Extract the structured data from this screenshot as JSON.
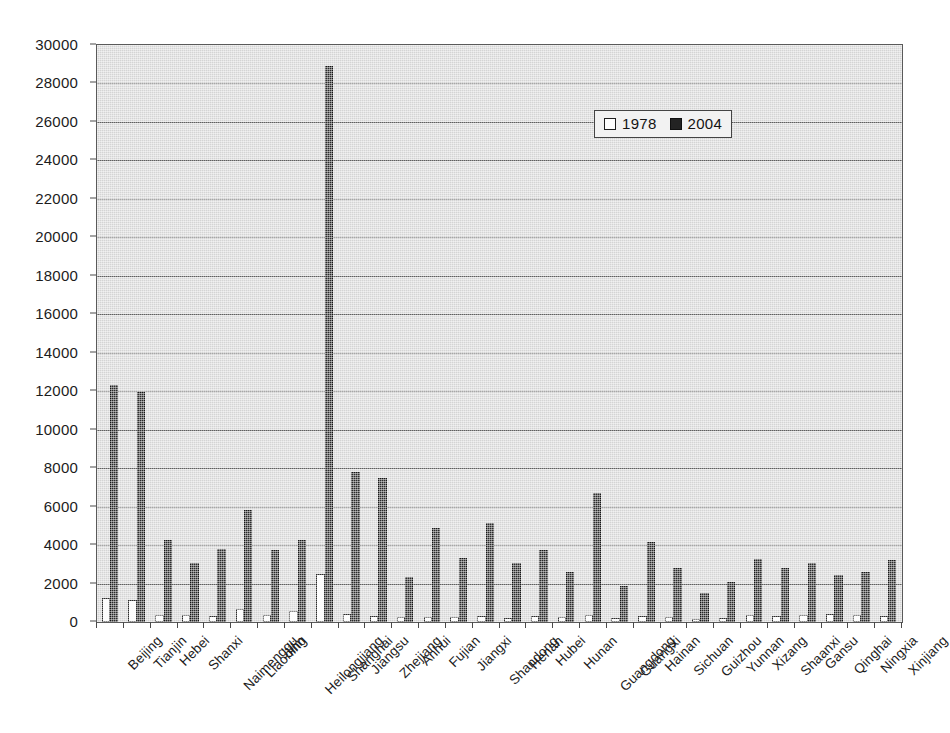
{
  "chart_data": {
    "type": "bar",
    "title": "",
    "subtitle": "",
    "xlabel": "",
    "ylabel": "",
    "ylim": [
      0,
      30000
    ],
    "ytick_step": 2000,
    "yticks": [
      "0",
      "2000",
      "4000",
      "6000",
      "8000",
      "10000",
      "12000",
      "14000",
      "16000",
      "18000",
      "20000",
      "22000",
      "24000",
      "26000",
      "28000",
      "30000"
    ],
    "grid": true,
    "legend_position": "upper-center",
    "plot_background": "#d4d4d4",
    "categories": [
      "Beijing",
      "Tianjin",
      "Hebei",
      "Shanxi",
      "Naimenggu",
      "Liaoning",
      "Jilin",
      "Heilongjiang",
      "Shanghai",
      "Jiangsu",
      "Zhejiang",
      "Anhui",
      "Fujian",
      "Jiangxi",
      "Shandong",
      "Henan",
      "Hubei",
      "Hunan",
      "Guangdong",
      "Guangxi",
      "Hainan",
      "Sichuan",
      "Guizhou",
      "Yunnan",
      "Xizang",
      "Shaanxi",
      "Gansu",
      "Qinghai",
      "Ningxia",
      "Xinjiang"
    ],
    "series": [
      {
        "name": "1978",
        "color": "#ffffff",
        "edge_color": "#1f1f1f",
        "values": [
          1257,
          1160,
          364,
          365,
          317,
          680,
          381,
          564,
          2498,
          430,
          331,
          244,
          273,
          276,
          316,
          232,
          332,
          285,
          367,
          225,
          313,
          261,
          175,
          226,
          375,
          291,
          348,
          428,
          370,
          313
        ]
      },
      {
        "name": "2004",
        "color": "#232323",
        "edge_color": "#101010",
        "values": [
          12300,
          11980,
          4240,
          3070,
          3800,
          5800,
          3760,
          4250,
          28900,
          7800,
          7500,
          2360,
          4900,
          3320,
          5130,
          3080,
          3760,
          2580,
          6700,
          1880,
          4160,
          2800,
          1510,
          2060,
          3270,
          2800,
          3060,
          2440,
          2610,
          3230
        ]
      }
    ],
    "legend_entries": [
      "1978",
      "2004"
    ]
  }
}
